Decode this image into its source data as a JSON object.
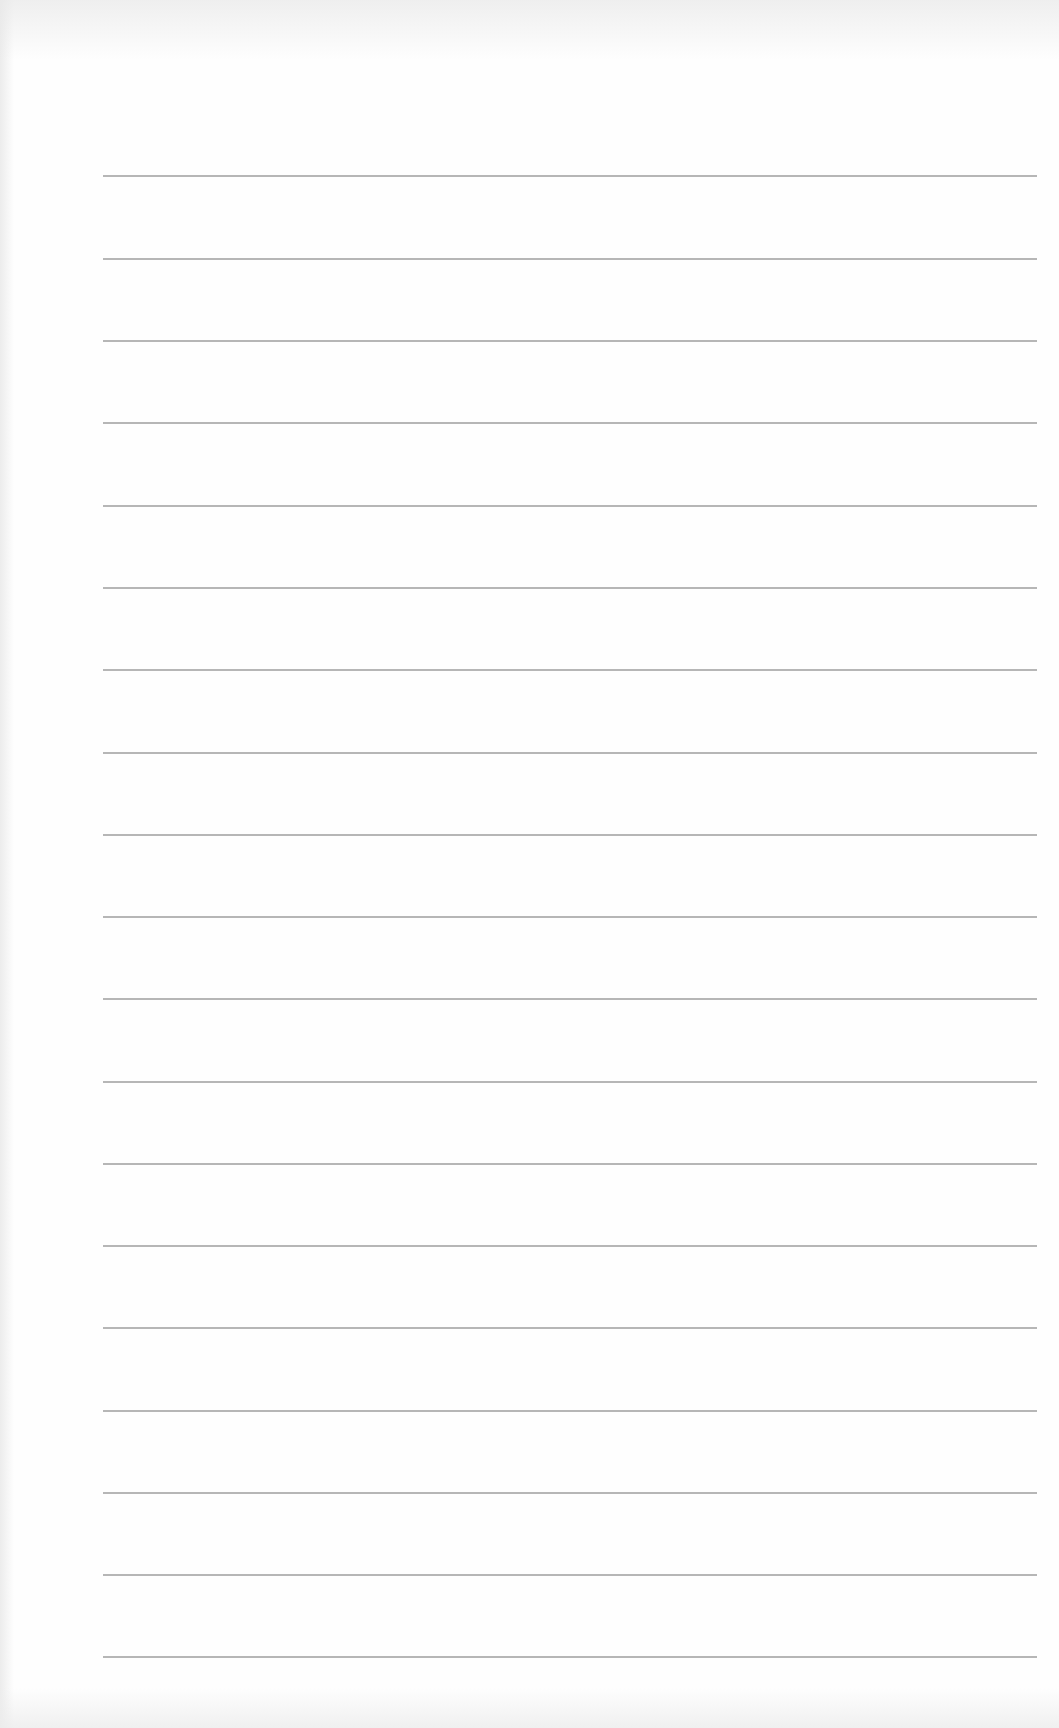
{
  "document": {
    "type": "blank lined page",
    "rule_count": 19,
    "rule_color": "#a9a9a9",
    "background_color": "#fefefe",
    "rules_top_px": [
      175,
      258,
      340,
      422,
      505,
      587,
      669,
      752,
      834,
      916,
      998,
      1081,
      1163,
      1245,
      1327,
      1410,
      1492,
      1574,
      1656
    ]
  }
}
